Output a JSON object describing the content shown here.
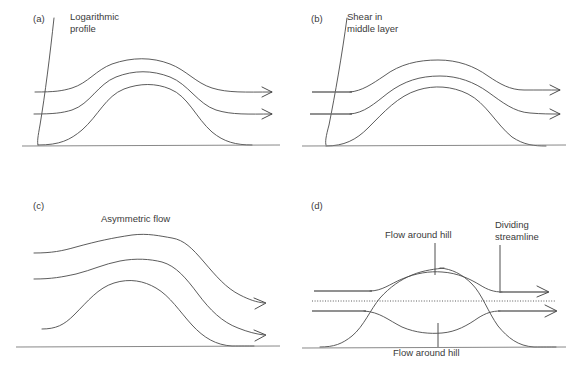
{
  "figure": {
    "background_color": "#ffffff",
    "line_color": "#4a4a4a",
    "text_color": "#3a3a3a",
    "width": 580,
    "height": 366
  },
  "panels": [
    {
      "id": "a",
      "letter": "(a)",
      "label_lines": [
        "Logarithmic",
        "profile"
      ],
      "label_full": "Logarithmic profile",
      "description": "Three streamlines lift symmetrically over the hill; a logarithmic wind-speed profile curve rises from the surface at the left.",
      "has_profile_curve": true,
      "streamline_count": 3,
      "arrow_count": 2,
      "ground_label": ""
    },
    {
      "id": "b",
      "letter": "(b)",
      "label_lines": [
        "Shear in",
        "middle layer"
      ],
      "label_full": "Shear in middle layer",
      "description": "Same lifting streamlines, but the inflow segments are straight and offset, showing shear concentrated in the middle layer.",
      "has_profile_curve": true,
      "streamline_count": 3,
      "arrow_count": 2,
      "ground_label": ""
    },
    {
      "id": "c",
      "letter": "(c)",
      "label_lines": [
        "Asymmetric flow"
      ],
      "label_full": "Asymmetric flow",
      "description": "Crest displaced downwind with a steep lee-side descent; outflow arrows end lower than the inflow height.",
      "has_profile_curve": false,
      "streamline_count": 3,
      "arrow_count": 2,
      "ground_label": ""
    },
    {
      "id": "d",
      "letter": "(d)",
      "label_lines": [
        "Flow around hill"
      ],
      "label_full": "Flow around hill",
      "second_label": "Dividing streamline",
      "second_label_lines": [
        "Dividing",
        "streamline"
      ],
      "ground_label": "Flow around hill",
      "description": "A lens-shaped split: air above the dividing streamline passes over the hill while air below is deflected around it. A dotted horizontal line marks the dividing streamline level.",
      "has_profile_curve": false,
      "has_dotted_line": true,
      "streamline_count": 4,
      "arrow_count": 2
    }
  ],
  "annotations": {
    "panel_a_label_x": 70,
    "panel_a_label_y": 17,
    "panel_b_label_x": 347,
    "panel_b_label_y": 17,
    "panel_c_label_x": 131,
    "panel_c_label_y": 218,
    "panel_d_top_label": "Flow around hill",
    "panel_d_right_label": "Dividing streamline",
    "panel_d_bottom_label": "Flow around hill"
  },
  "icons": {
    "arrow": "arrow-head-right",
    "dotted": "dotted-divider"
  }
}
